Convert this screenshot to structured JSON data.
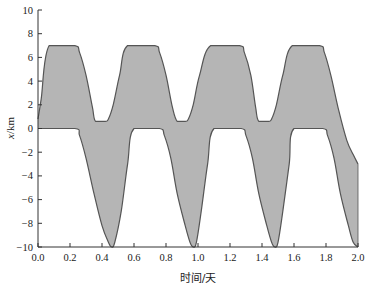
{
  "chart_data": {
    "type": "area",
    "title": "",
    "xlabel": "时间/天",
    "ylabel_var": "x",
    "ylabel_unit": "/km",
    "xlim": [
      0.0,
      2.0
    ],
    "ylim": [
      -10,
      10
    ],
    "xticks": [
      "0.0",
      "0.2",
      "0.4",
      "0.6",
      "0.8",
      "1.0",
      "1.2",
      "1.4",
      "1.6",
      "1.8",
      "2.0"
    ],
    "yticks": [
      "10",
      "8",
      "6",
      "4",
      "2",
      "0",
      "-2",
      "-4",
      "-6",
      "-8",
      "-10"
    ],
    "grid": false,
    "legend": null,
    "fill_color": "#b5b5b5",
    "line_color": "#555555",
    "series": [
      {
        "name": "upper_bound",
        "x": [
          0.0,
          0.02,
          0.07,
          0.23,
          0.26,
          0.3,
          0.34,
          0.36,
          0.42,
          0.44,
          0.47,
          0.51,
          0.56,
          0.73,
          0.76,
          0.8,
          0.84,
          0.87,
          0.92,
          0.94,
          0.97,
          1.01,
          1.08,
          1.26,
          1.29,
          1.33,
          1.36,
          1.38,
          1.44,
          1.46,
          1.49,
          1.53,
          1.59,
          1.76,
          1.79,
          1.83,
          1.88,
          1.93,
          1.97,
          2.0
        ],
        "values": [
          0.8,
          2.5,
          7.0,
          7.0,
          6.4,
          4.5,
          1.8,
          0.6,
          0.6,
          0.8,
          2.0,
          4.5,
          7.0,
          7.0,
          6.4,
          4.5,
          1.8,
          0.6,
          0.6,
          0.8,
          2.0,
          4.5,
          7.0,
          7.0,
          6.4,
          4.5,
          1.8,
          0.6,
          0.6,
          0.8,
          2.0,
          4.5,
          7.0,
          7.0,
          6.4,
          4.5,
          1.5,
          -1.0,
          -2.2,
          -3.0
        ]
      },
      {
        "name": "lower_bound",
        "x": [
          0.0,
          0.23,
          0.26,
          0.3,
          0.35,
          0.4,
          0.44,
          0.46,
          0.48,
          0.52,
          0.56,
          0.6,
          0.76,
          0.79,
          0.83,
          0.87,
          0.92,
          0.95,
          0.97,
          0.99,
          1.02,
          1.06,
          1.1,
          1.27,
          1.3,
          1.34,
          1.38,
          1.43,
          1.46,
          1.48,
          1.5,
          1.53,
          1.57,
          1.6,
          1.78,
          1.81,
          1.85,
          1.89,
          1.94,
          1.97,
          2.0
        ],
        "values": [
          0.0,
          0.0,
          -0.6,
          -2.5,
          -5.5,
          -8.2,
          -9.6,
          -10.0,
          -9.6,
          -7.0,
          -3.0,
          0.0,
          0.0,
          -0.6,
          -2.5,
          -5.5,
          -8.2,
          -9.6,
          -10.0,
          -9.6,
          -7.0,
          -3.0,
          0.0,
          0.0,
          -0.6,
          -2.5,
          -5.5,
          -8.2,
          -9.6,
          -10.0,
          -9.6,
          -7.0,
          -3.0,
          0.0,
          0.0,
          -0.6,
          -2.5,
          -5.5,
          -8.2,
          -9.6,
          -10.0
        ]
      }
    ]
  },
  "plot_area": {
    "x0": 38,
    "x1": 358,
    "y_top": 10,
    "y_bottom": 247
  }
}
